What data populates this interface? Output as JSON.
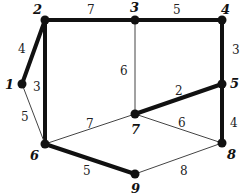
{
  "graph": {
    "title": "",
    "nodes": [
      {
        "id": "1",
        "x": 22,
        "y": 84,
        "lx": 5,
        "ly": 89
      },
      {
        "id": "2",
        "x": 45,
        "y": 20,
        "lx": 33,
        "ly": 14
      },
      {
        "id": "3",
        "x": 135,
        "y": 20,
        "lx": 130,
        "ly": 12
      },
      {
        "id": "4",
        "x": 222,
        "y": 20,
        "lx": 221,
        "ly": 14
      },
      {
        "id": "5",
        "x": 222,
        "y": 84,
        "lx": 230,
        "ly": 88
      },
      {
        "id": "6",
        "x": 45,
        "y": 144,
        "lx": 30,
        "ly": 160
      },
      {
        "id": "7",
        "x": 135,
        "y": 114,
        "lx": 131,
        "ly": 134
      },
      {
        "id": "8",
        "x": 222,
        "y": 143,
        "lx": 227,
        "ly": 159
      },
      {
        "id": "9",
        "x": 135,
        "y": 174,
        "lx": 131,
        "ly": 193
      }
    ],
    "edges": [
      {
        "from": "1",
        "to": "2",
        "weight": "4",
        "highlighted": true,
        "lx": 18,
        "ly": 53
      },
      {
        "from": "2",
        "to": "3",
        "weight": "7",
        "highlighted": true,
        "lx": 87,
        "ly": 14
      },
      {
        "from": "3",
        "to": "4",
        "weight": "5",
        "highlighted": true,
        "lx": 173,
        "ly": 14
      },
      {
        "from": "2",
        "to": "6",
        "weight": "3",
        "highlighted": true,
        "lx": 33,
        "ly": 91
      },
      {
        "from": "1",
        "to": "6",
        "weight": "5",
        "highlighted": false,
        "lx": 21,
        "ly": 121
      },
      {
        "from": "3",
        "to": "7",
        "weight": "6",
        "highlighted": false,
        "lx": 120,
        "ly": 75
      },
      {
        "from": "4",
        "to": "5",
        "weight": "3",
        "highlighted": true,
        "lx": 232,
        "ly": 54
      },
      {
        "from": "5",
        "to": "7",
        "weight": "2",
        "highlighted": true,
        "lx": 175,
        "ly": 95
      },
      {
        "from": "6",
        "to": "7",
        "weight": "7",
        "highlighted": false,
        "lx": 86,
        "ly": 128
      },
      {
        "from": "7",
        "to": "8",
        "weight": "6",
        "highlighted": false,
        "lx": 178,
        "ly": 127
      },
      {
        "from": "5",
        "to": "8",
        "weight": "4",
        "highlighted": true,
        "lx": 230,
        "ly": 127
      },
      {
        "from": "6",
        "to": "9",
        "weight": "5",
        "highlighted": true,
        "lx": 83,
        "ly": 175
      },
      {
        "from": "9",
        "to": "8",
        "weight": "8",
        "highlighted": false,
        "lx": 180,
        "ly": 175
      }
    ],
    "colors": {
      "edge": "#111111",
      "thin_edge": "#444444",
      "node": "#111111"
    }
  }
}
